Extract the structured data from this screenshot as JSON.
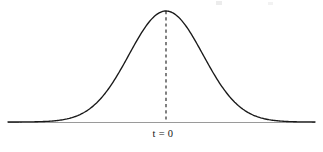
{
  "figure": {
    "background_color": "#ffffff",
    "width": 323,
    "height": 152,
    "center_label": "t = 0"
  },
  "chart_data": {
    "type": "line",
    "title": "",
    "subtitle": "",
    "xlabel": "",
    "ylabel": "",
    "grid": false,
    "legend": null,
    "curve_name": "t distribution density",
    "annotations": [
      {
        "name": "center-marker",
        "text": "t = 0",
        "x": 0,
        "style": "dashed vertical line from peak to axis"
      }
    ],
    "axis": {
      "x_pixel_start": 8,
      "x_pixel_end": 315,
      "baseline_pixel_y": 122,
      "axis_color": "#9a9a9a",
      "x_range": [
        -4.3,
        4.0
      ],
      "y_range": [
        0,
        1
      ]
    },
    "curve": {
      "color": "#1a1a1a",
      "peak_pixel": [
        166,
        11
      ],
      "sigma_pixels": 37,
      "mean": 0,
      "x": [
        -4.3,
        -4.0,
        -3.6,
        -3.2,
        -2.8,
        -2.4,
        -2.0,
        -1.6,
        -1.2,
        -0.8,
        -0.4,
        0.0,
        0.4,
        0.8,
        1.2,
        1.6,
        2.0,
        2.4,
        2.8,
        3.2,
        3.6,
        4.0
      ],
      "y": [
        0.0001,
        0.0003,
        0.0015,
        0.006,
        0.0198,
        0.0561,
        0.1353,
        0.278,
        0.4868,
        0.7261,
        0.9231,
        1.0,
        0.9231,
        0.7261,
        0.4868,
        0.278,
        0.1353,
        0.0561,
        0.0198,
        0.006,
        0.0015,
        0.0003
      ]
    }
  }
}
